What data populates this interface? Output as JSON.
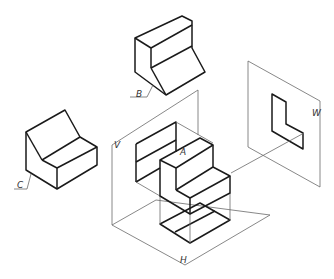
{
  "figure": {
    "labels": {
      "A": "A",
      "B": "B",
      "C": "C",
      "V": "V",
      "H": "H",
      "W": "W"
    },
    "colors": {
      "line": "#1a1a1a",
      "plane_line": "#6a6a6a",
      "background": "#ffffff"
    }
  }
}
